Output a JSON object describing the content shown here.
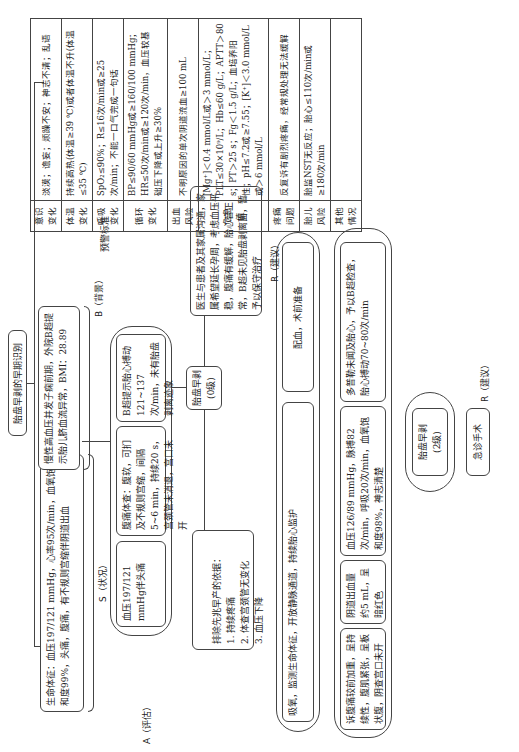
{
  "title": "胎盘早剥的早期识别",
  "sections": {
    "s_label": "S（状况）",
    "b_label": "B（背景）",
    "a_label": "A（评估）",
    "r_label_1": "R（建议）",
    "r_label_2": "R（建议）",
    "warning_label": "预警标准"
  },
  "boxes": {
    "situation": "生命体征：血压197/121 mmHg，心率95次/min，血氧饱和度99%，头痛，腹痛，有不规则宫缩伴阴道出血",
    "background": "慢性高血压并发子痫前期，外院B超提示胎儿脐血流异常，BMI：28.89",
    "a_bp": "血压197/121 mmHg伴头痛",
    "a_abdomen": "腹痛体查：腹软，可扪及不规则宫缩，间隔5~6 min，持续20 s，宫颈管未消退，宫口未开",
    "a_ultrasound": "B超提示胎心搏动121~137次/min，未有胎盘剥离迹象",
    "a_exclude": "排除先兆早产的依据：\n1. 持续疼痛\n2. 体查宫颈管无变化\n3. 血压下降",
    "center_node": "胎盘早剥\n(0级)",
    "communication": "医生与患者及其家属沟通，家属希望延长孕周，考虑血压平稳，腹痛有缓解，胎心音正常，B超未见胎盘剥离面，暂予以保守治疗",
    "r_monitor": "吸氧，监测生命体征，开放静脉通道，持续胎心监护",
    "r_prepare": "配血，术前准备",
    "e_pain": "诉腹痛较前加重，呈持续性，腹肌紧张，呈板状腹，阴查宫口未开",
    "e_bleeding": "阴道出血量约5 mL，呈暗红色",
    "e_vitals": "血压126/89 mmHg，脉搏82次/min，呼吸20次/min，血氧饱和度98%，神志清楚",
    "e_doppler": "多普勒未闻及胎心，予以B超检查，胎心搏动70~80次/min",
    "grade2_node": "胎盘早剥\n(2级)",
    "emergency_surgery": "急诊手术"
  },
  "criteria_table": {
    "rows": [
      {
        "key": "意识变化",
        "value": "淡漠；谵妄；烦躁不安；神志不清；乱语"
      },
      {
        "key": "体温变化",
        "value": "持续高热(体温≥39 ℃)或者体温不升(体温≤35 ℃)"
      },
      {
        "key": "呼吸变化",
        "value": "SpO₂≤90%；R≤16次/min或≥25次/min；不能一口气完成一句话"
      },
      {
        "key": "循环变化",
        "value": "BP≤90/60 mmHg或≥160/100 mmHg；HR≤50次/min或≥120次/min，血压较基础压下降或上升≥30%"
      },
      {
        "key": "出血风险",
        "value": "不明原因的单次阴道流血≥100 mL"
      },
      {
        "key": "危急值",
        "value": "[Mg⁺]＜0.4 mmol/L或＞3 mmol/L；PLT≤30×10⁹/L；Hb≤60 g/L；APTT＞80 s；PT＞25 s；Fg＜1.5 g/L；血培养阳性；pH≤7.2或≥7.55；[K⁺]＜3.0 mmol/L或＞6 mmol/L"
      },
      {
        "key": "疼痛问题",
        "value": "反复诉有剧烈疼痛，经常规处理无法缓解"
      },
      {
        "key": "胎儿风险",
        "value": "胎监NST无反应；胎心≤110次/min或≥180次/min"
      },
      {
        "key": "其他情况",
        "value": ""
      }
    ]
  }
}
